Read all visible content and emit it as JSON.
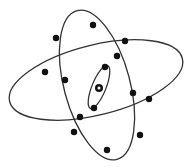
{
  "diagram": {
    "type": "atom-model",
    "colors": {
      "line": "#333333",
      "electron": "#111111",
      "background": "#ffffff"
    },
    "nucleus": {
      "cx": 99,
      "cy": 88,
      "r": 4,
      "style": "ring"
    },
    "orbits": [
      {
        "name": "outer-orbit-steep",
        "cx": 97,
        "cy": 85,
        "rx": 33,
        "ry": 77,
        "rotate": -15,
        "electrons": [
          [
            56,
            38
          ],
          [
            93,
            25
          ],
          [
            117,
            56
          ],
          [
            133,
            93
          ],
          [
            140,
            135
          ],
          [
            107,
            150
          ],
          [
            80,
            117
          ],
          [
            65,
            80
          ]
        ]
      },
      {
        "name": "outer-orbit-flat",
        "cx": 96,
        "cy": 80,
        "rx": 89,
        "ry": 35,
        "rotate": -14,
        "electrons": [
          [
            125,
            41
          ],
          [
            45,
            72
          ],
          [
            149,
            99
          ],
          [
            74,
            132
          ]
        ]
      },
      {
        "name": "inner-orbit",
        "cx": 99,
        "cy": 87,
        "rx": 7,
        "ry": 23,
        "rotate": 22,
        "electrons": [
          [
            105,
            67
          ],
          [
            94,
            108
          ]
        ]
      }
    ]
  }
}
